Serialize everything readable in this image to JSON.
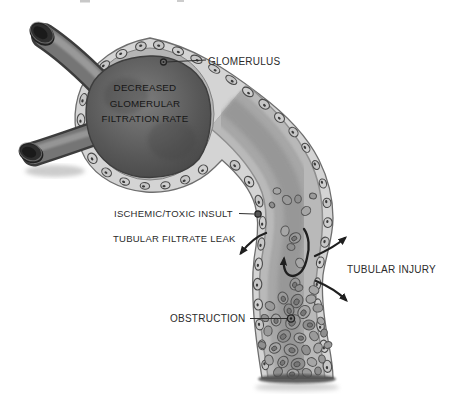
{
  "diagram": {
    "labels": {
      "glomerulus": "GLOMERULUS",
      "ischemic_insult": "ISCHEMIC/TOXIC INSULT",
      "tubular_filtrate_leak": "TUBULAR FILTRATE LEAK",
      "tubular_injury": "TUBULAR INJURY",
      "obstruction": "OBSTRUCTION"
    },
    "gfr_lines": [
      "DECREASED",
      "GLOMERULAR",
      "FILTRATION RATE"
    ],
    "colors": {
      "background": "#ffffff",
      "ink": "#1f1f1f",
      "wall": "#d4d4d4",
      "lumen": "#a8a8a8",
      "glomerulus_fill": "#565656"
    }
  }
}
